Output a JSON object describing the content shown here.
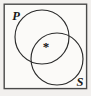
{
  "diagram": {
    "kind": "venn-diagram",
    "universe": {
      "name": "universal-set-box",
      "shape": "rectangle",
      "border_color": "#4a4a4a",
      "fill_color": "#fbfaf8"
    },
    "background_color": "#f2f0ee",
    "stroke_color": "#2b2b2b",
    "sets": [
      {
        "id": "P",
        "label": "P",
        "position": "upper-left",
        "label_x": 16,
        "label_y": 20,
        "center_x": 42,
        "center_y": 37,
        "radius": 27
      },
      {
        "id": "S",
        "label": "S",
        "position": "lower-right",
        "label_x": 80,
        "label_y": 86,
        "center_x": 57,
        "center_y": 59,
        "radius": 26
      }
    ],
    "markers": [
      {
        "id": "element-star",
        "glyph": "*",
        "region": "intersection-P-and-S",
        "x": 46,
        "y": 51
      }
    ]
  }
}
